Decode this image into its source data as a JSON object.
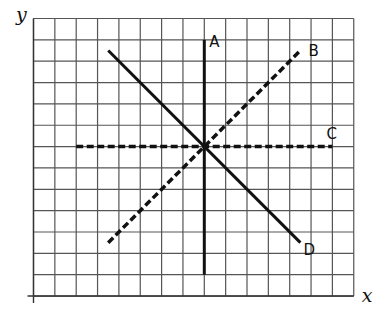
{
  "figure": {
    "grid": {
      "columns": 15,
      "rows": 13
    },
    "axes": {
      "x_label": "x",
      "y_label": "y"
    },
    "lines": [
      {
        "label": "A",
        "style": "solid",
        "from": [
          8,
          1
        ],
        "to": [
          8,
          12
        ]
      },
      {
        "label": "B",
        "style": "dashed",
        "from": [
          3.5,
          10.5
        ],
        "to": [
          12.5,
          1.5
        ]
      },
      {
        "label": "C",
        "style": "dashed",
        "from": [
          2,
          6
        ],
        "to": [
          14,
          6
        ]
      },
      {
        "label": "D",
        "style": "solid",
        "from": [
          3.5,
          1.5
        ],
        "to": [
          12.5,
          10.5
        ]
      }
    ],
    "intersection": [
      8,
      6
    ],
    "color": "#111111"
  }
}
